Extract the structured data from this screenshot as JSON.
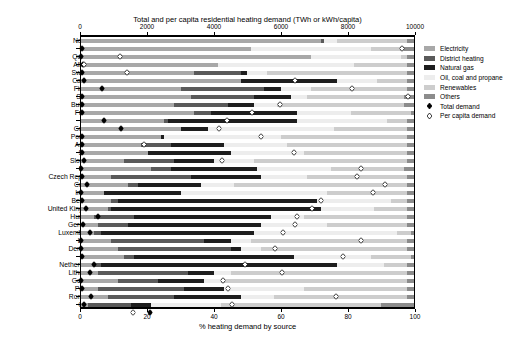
{
  "chart_data": {
    "type": "bar",
    "title": "Total and per capita residential heating demand (TWh or kWh/capita)",
    "xlabel": "% heating demand by source",
    "ylabel": "",
    "orientation": "horizontal",
    "stacked": true,
    "grid": false,
    "top_axis": {
      "label": "Total and per capita residential heating demand (TWh or kWh/capita)",
      "ticks": [
        0,
        2000,
        4000,
        6000,
        8000,
        10000
      ],
      "tick_labels": [
        "0",
        "2000",
        "4000",
        "6000",
        "8000",
        "10000"
      ],
      "range": [
        0,
        10000
      ]
    },
    "bottom_axis": {
      "label": "% heating demand by source",
      "ticks": [
        0,
        20,
        40,
        60,
        80,
        100
      ],
      "tick_labels": [
        "0",
        "20",
        "40",
        "60",
        "80",
        "100"
      ],
      "range": [
        0,
        100
      ]
    },
    "legend": {
      "position": "right",
      "series_entries": [
        {
          "name": "Electricity",
          "color": "#a8a8a8"
        },
        {
          "name": "District heating",
          "color": "#5a5a5a"
        },
        {
          "name": "Natural gas",
          "color": "#1e1e1e"
        },
        {
          "name": "Oil, coal and propane",
          "color": "#ededed"
        },
        {
          "name": "Renewables",
          "color": "#cdcdcd"
        },
        {
          "name": "Others",
          "color": "#8c8c8c"
        }
      ],
      "marker_entries": [
        {
          "name": "Total demand",
          "marker": "filled-diamond"
        },
        {
          "name": "Per capita demand",
          "marker": "open-diamond"
        }
      ]
    },
    "categories": [
      "Norway",
      "Malta",
      "Quebec",
      "Albania",
      "Sweden",
      "Canada",
      "Finland",
      "Serbia",
      "Bulgaria",
      "France",
      "USA",
      "Greece",
      "Portugal",
      "Austria",
      "Spain",
      "Slovenia",
      "EU28",
      "Czech Republic",
      "Croatia",
      "Ireland",
      "Belgium",
      "United Kingdom",
      "Hungary",
      "Germany",
      "Luxembourg",
      "Latvia",
      "Denmark",
      "Italy",
      "Netherlands",
      "Lithuania",
      "Georgia",
      "Poland",
      "Romania",
      "China"
    ],
    "series": [
      {
        "name": "Electricity",
        "values": [
          72,
          51,
          69,
          41,
          34,
          48,
          30,
          33,
          28,
          34,
          25,
          30,
          24,
          18,
          20,
          13,
          21,
          9,
          14,
          7,
          9,
          8,
          4,
          5,
          4,
          9,
          11,
          13,
          4,
          5,
          11,
          5,
          8,
          2
        ]
      },
      {
        "name": "District heating",
        "values": [
          1,
          0,
          0,
          0,
          14,
          0,
          25,
          19,
          16,
          5,
          1,
          0,
          0,
          9,
          0,
          15,
          6,
          24,
          3,
          0,
          2,
          1,
          12,
          9,
          2,
          28,
          34,
          3,
          2,
          27,
          12,
          26,
          20,
          13
        ]
      },
      {
        "name": "Natural gas",
        "values": [
          0,
          0,
          0,
          0,
          2,
          29,
          5,
          11,
          8,
          26,
          39,
          8,
          1,
          16,
          25,
          12,
          26,
          21,
          19,
          23,
          60,
          63,
          41,
          40,
          46,
          8,
          3,
          48,
          71,
          8,
          14,
          12,
          20,
          6
        ]
      },
      {
        "name": "Oil, coal and propane",
        "values": [
          4,
          36,
          27,
          41,
          6,
          12,
          9,
          5,
          7,
          16,
          27,
          38,
          35,
          19,
          22,
          12,
          22,
          14,
          10,
          44,
          22,
          16,
          10,
          20,
          43,
          6,
          6,
          23,
          14,
          5,
          5,
          24,
          10,
          21
        ]
      },
      {
        "name": "Renewables",
        "values": [
          21,
          10,
          2,
          16,
          42,
          9,
          29,
          29,
          38,
          18,
          6,
          22,
          38,
          36,
          31,
          46,
          22,
          30,
          52,
          24,
          5,
          10,
          31,
          24,
          4,
          47,
          44,
          12,
          7,
          53,
          56,
          31,
          40,
          48
        ]
      },
      {
        "name": "Others",
        "values": [
          2,
          3,
          2,
          2,
          2,
          2,
          2,
          3,
          3,
          1,
          2,
          2,
          2,
          2,
          2,
          2,
          3,
          2,
          2,
          2,
          2,
          2,
          2,
          2,
          1,
          2,
          2,
          1,
          2,
          2,
          2,
          2,
          2,
          10
        ]
      }
    ],
    "total_demand": [
      60,
      40,
      100,
      70,
      130,
      650,
      70,
      70,
      60,
      730,
      1230,
      60,
      50,
      70,
      130,
      40,
      60,
      200,
      40,
      50,
      190,
      540,
      80,
      290,
      20,
      40,
      60,
      430,
      310,
      40,
      50,
      320,
      110,
      2080
    ],
    "per_capita_demand": [
      9600,
      1180,
      120,
      1390,
      6420,
      8110,
      9800,
      5970,
      5130,
      4400,
      4160,
      5410,
      1920,
      6400,
      4240,
      8400,
      8260,
      9100,
      8750,
      7180,
      6930,
      6480,
      6420,
      6070,
      8380,
      5830,
      7840,
      4930,
      6020,
      4280,
      4420,
      7630,
      4540,
      1570
    ]
  },
  "figure": {
    "background": "#ffffff",
    "axis_color": "#000000"
  }
}
